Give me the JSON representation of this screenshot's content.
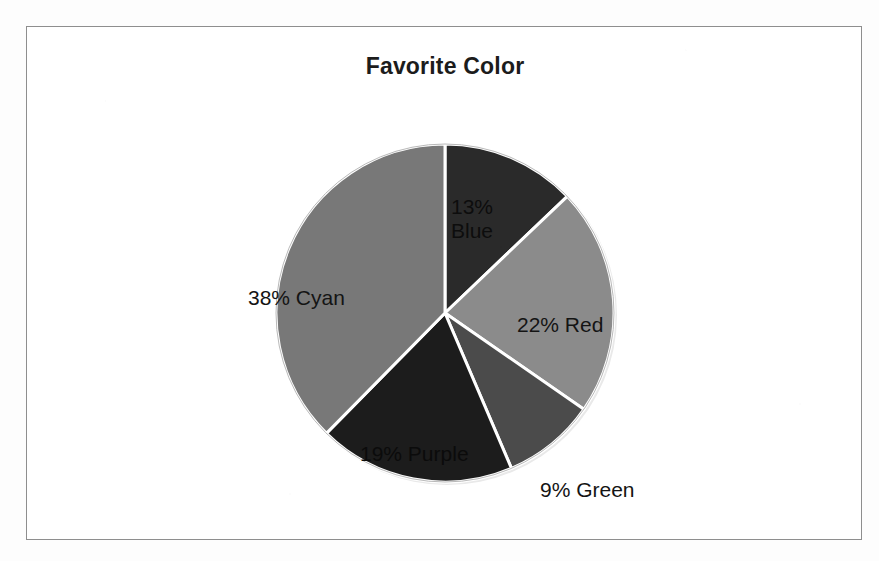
{
  "document": {
    "kind": "scanned-chart-page",
    "background_color": "#fdfdfd",
    "frame_border_color": "#8e8e8e"
  },
  "chart_data": {
    "type": "pie",
    "title": "Favorite Color",
    "xlabel": "",
    "ylabel": "",
    "legend": "none",
    "grid": false,
    "labels_position": "slice-annotations",
    "start_angle_deg": 0,
    "direction": "clockwise",
    "categories": [
      "Blue",
      "Red",
      "Green",
      "Purple",
      "Cyan"
    ],
    "values": [
      13,
      22,
      9,
      19,
      38
    ],
    "value_unit": "percent",
    "slices": [
      {
        "name": "Blue",
        "percent": 13,
        "label": "13%\nBlue",
        "percent_text": "13%",
        "color": "#2b2b2b",
        "label_color": "#0d0d0d",
        "label_placement": "inside",
        "start_angle_deg": 0,
        "end_angle_deg": 46.8
      },
      {
        "name": "Red",
        "percent": 22,
        "label": "22% Red",
        "percent_text": "22%",
        "color": "#8b8b8b",
        "label_color": "#141414",
        "label_placement": "inside",
        "start_angle_deg": 46.8,
        "end_angle_deg": 126.0
      },
      {
        "name": "Green",
        "percent": 9,
        "label": "9% Green",
        "percent_text": "9%",
        "color": "#4c4c4c",
        "label_color": "#141414",
        "label_placement": "outside",
        "start_angle_deg": 126.0,
        "end_angle_deg": 158.4
      },
      {
        "name": "Purple",
        "percent": 19,
        "label": "19% Purple",
        "percent_text": "19%",
        "color": "#1f1f1f",
        "label_color": "#0b0b0b",
        "label_placement": "inside",
        "start_angle_deg": 158.4,
        "end_angle_deg": 226.8
      },
      {
        "name": "Cyan",
        "percent": 38,
        "label": "38% Cyan",
        "percent_text": "38%",
        "color": "#787878",
        "label_color": "#141414",
        "label_placement": "inside",
        "start_angle_deg": 226.8,
        "end_angle_deg": 360.0
      }
    ],
    "total_percent": 101,
    "separator_color": "#ffffff"
  }
}
